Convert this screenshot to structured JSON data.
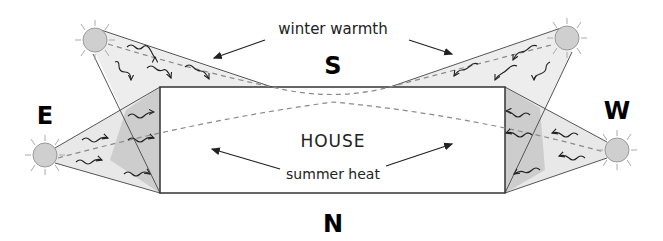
{
  "diagram": {
    "type": "passive solar orientation diagram",
    "compass": {
      "north": "N",
      "south": "S",
      "east": "E",
      "west": "W"
    },
    "house_label": "HOUSE",
    "annotations": {
      "winter": "winter warmth",
      "summer": "summer heat"
    },
    "suns": [
      {
        "id": "winter-sun-east",
        "season": "winter",
        "side": "east"
      },
      {
        "id": "winter-sun-west",
        "season": "winter",
        "side": "west"
      },
      {
        "id": "summer-sun-east",
        "season": "summer",
        "side": "east"
      },
      {
        "id": "summer-sun-west",
        "season": "summer",
        "side": "west"
      }
    ],
    "colors": {
      "sun_fill": "#cfcfcf",
      "sun_stroke": "#9a9a9a",
      "light_wedge": "#ececec",
      "overlap_wedge": "#cbcbcb",
      "outline": "#444444",
      "dashed_path": "#8a8a8a"
    }
  }
}
